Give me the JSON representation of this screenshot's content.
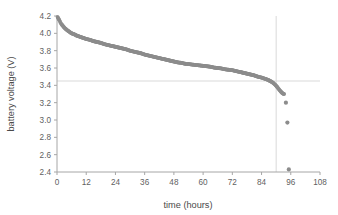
{
  "chart_data": {
    "type": "scatter",
    "title": "",
    "xlabel": "time (hours)",
    "ylabel": "battery voltage (V)",
    "xlim": [
      0,
      108
    ],
    "ylim": [
      2.4,
      4.2
    ],
    "xticks": [
      0,
      12,
      24,
      36,
      48,
      60,
      72,
      84,
      96,
      108
    ],
    "yticks": [
      2.4,
      2.6,
      2.8,
      3.0,
      3.2,
      3.4,
      3.6,
      3.8,
      4.0,
      4.2
    ],
    "xtick_labels": [
      "0",
      "12",
      "24",
      "36",
      "48",
      "60",
      "72",
      "84",
      "96",
      "108"
    ],
    "ytick_labels": [
      "2.4",
      "2.6",
      "2.8",
      "3.0",
      "3.2",
      "3.4",
      "3.6",
      "3.8",
      "4.0",
      "4.2"
    ],
    "grid": false,
    "legend": null,
    "marker_color": "#8c8c8c",
    "axis_color": "#a6a6a6",
    "reference_lines": [
      {
        "orientation": "horizontal",
        "value": 3.45,
        "color": "#d9d9d9"
      },
      {
        "orientation": "vertical",
        "value": 90.0,
        "color": "#d9d9d9"
      }
    ],
    "series": [
      {
        "name": "battery discharge",
        "x": [
          0.2,
          0.6,
          1.0,
          1.5,
          2.0,
          2.6,
          3.2,
          4.0,
          5.0,
          6.0,
          7.0,
          8.0,
          9.0,
          10.0,
          11.0,
          12.0,
          13.5,
          15.0,
          16.5,
          18.0,
          19.5,
          21.0,
          22.5,
          24.0,
          25.5,
          27.0,
          28.5,
          30.0,
          31.5,
          33.0,
          34.5,
          36.0,
          37.5,
          39.0,
          40.5,
          42.0,
          43.5,
          45.0,
          46.5,
          48.0,
          49.5,
          51.0,
          52.5,
          54.0,
          55.5,
          57.0,
          58.5,
          60.0,
          61.5,
          63.0,
          64.5,
          66.0,
          67.5,
          69.0,
          70.5,
          72.0,
          73.5,
          75.0,
          76.5,
          78.0,
          79.5,
          81.0,
          82.5,
          84.0,
          85.5,
          86.5,
          87.5,
          88.5,
          89.3,
          90.0,
          90.6,
          91.1,
          91.6,
          92.0,
          92.4,
          92.8,
          93.2
        ],
        "y": [
          4.19,
          4.17,
          4.15,
          4.12,
          4.1,
          4.08,
          4.06,
          4.04,
          4.02,
          4.0,
          3.99,
          3.975,
          3.965,
          3.955,
          3.945,
          3.935,
          3.925,
          3.91,
          3.9,
          3.89,
          3.875,
          3.865,
          3.855,
          3.845,
          3.835,
          3.825,
          3.815,
          3.8,
          3.79,
          3.78,
          3.77,
          3.755,
          3.745,
          3.735,
          3.725,
          3.715,
          3.705,
          3.695,
          3.685,
          3.675,
          3.665,
          3.66,
          3.65,
          3.645,
          3.64,
          3.635,
          3.63,
          3.625,
          3.62,
          3.615,
          3.605,
          3.6,
          3.595,
          3.585,
          3.58,
          3.575,
          3.565,
          3.555,
          3.545,
          3.535,
          3.525,
          3.515,
          3.5,
          3.49,
          3.475,
          3.465,
          3.45,
          3.435,
          3.415,
          3.395,
          3.375,
          3.355,
          3.34,
          3.325,
          3.315,
          3.305,
          3.3
        ],
        "tail_points": [
          {
            "x": 94.0,
            "y": 3.2
          },
          {
            "x": 94.6,
            "y": 2.97
          },
          {
            "x": 95.2,
            "y": 2.43
          }
        ]
      }
    ]
  }
}
